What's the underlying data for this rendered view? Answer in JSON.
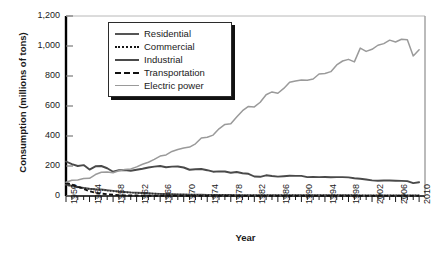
{
  "chart_data": {
    "type": "line",
    "title": "",
    "xlabel": "Year",
    "ylabel": "Consumption (millions of tons)",
    "xlim": [
      1950,
      2011
    ],
    "ylim": [
      0,
      1200
    ],
    "grid": false,
    "legend_position": "top-left-inside",
    "ytick_labels": [
      "0",
      "200",
      "400",
      "600",
      "800",
      "1,000",
      "1,200"
    ],
    "ytick_values": [
      0,
      200,
      400,
      600,
      800,
      1000,
      1200
    ],
    "xtick_labels": [
      "1950",
      "1954",
      "1958",
      "1962",
      "1966",
      "1970",
      "1974",
      "1978",
      "1982",
      "1986",
      "1990",
      "1994",
      "1998",
      "2002",
      "2006",
      "2010"
    ],
    "xtick_values": [
      1950,
      1954,
      1958,
      1962,
      1966,
      1970,
      1974,
      1978,
      1982,
      1986,
      1990,
      1994,
      1998,
      2002,
      2006,
      2010
    ],
    "x": [
      1950,
      1951,
      1952,
      1953,
      1954,
      1955,
      1956,
      1957,
      1958,
      1959,
      1960,
      1961,
      1962,
      1963,
      1964,
      1965,
      1966,
      1967,
      1968,
      1969,
      1970,
      1971,
      1972,
      1973,
      1974,
      1975,
      1976,
      1977,
      1978,
      1979,
      1980,
      1981,
      1982,
      1983,
      1984,
      1985,
      1986,
      1987,
      1988,
      1989,
      1990,
      1991,
      1992,
      1993,
      1994,
      1995,
      1996,
      1997,
      1998,
      1999,
      2000,
      2001,
      2002,
      2003,
      2004,
      2005,
      2006,
      2007,
      2008,
      2009,
      2010
    ],
    "series": [
      {
        "name": "Residential",
        "style": "solid",
        "color": "#555555",
        "values": [
          75,
          68,
          60,
          54,
          48,
          45,
          43,
          38,
          34,
          30,
          27,
          24,
          22,
          20,
          18,
          16,
          14,
          13,
          12,
          11,
          10,
          9,
          8,
          8,
          7,
          7,
          7,
          7,
          7,
          6,
          6,
          6,
          6,
          6,
          6,
          6,
          6,
          6,
          6,
          6,
          6,
          6,
          6,
          6,
          6,
          6,
          6,
          6,
          5,
          5,
          4,
          4,
          4,
          4,
          4,
          4,
          4,
          4,
          3,
          3,
          3
        ]
      },
      {
        "name": "Commercial",
        "style": "dotted",
        "color": "#151515",
        "values": [
          72,
          66,
          58,
          52,
          46,
          43,
          41,
          36,
          32,
          28,
          25,
          22,
          20,
          18,
          17,
          15,
          13,
          12,
          11,
          10,
          9,
          8,
          8,
          7,
          7,
          7,
          7,
          7,
          7,
          6,
          6,
          6,
          6,
          6,
          6,
          6,
          6,
          6,
          6,
          6,
          6,
          6,
          6,
          6,
          6,
          6,
          6,
          6,
          5,
          5,
          4,
          4,
          4,
          4,
          4,
          4,
          4,
          4,
          3,
          3,
          3
        ]
      },
      {
        "name": "Industrial",
        "style": "solid",
        "color": "#4a4a4a",
        "values": [
          230,
          212,
          200,
          206,
          176,
          198,
          200,
          185,
          162,
          172,
          173,
          168,
          175,
          182,
          190,
          196,
          200,
          192,
          196,
          197,
          190,
          175,
          178,
          180,
          172,
          162,
          164,
          163,
          155,
          160,
          152,
          148,
          130,
          128,
          138,
          133,
          129,
          132,
          135,
          134,
          134,
          126,
          127,
          126,
          127,
          125,
          126,
          126,
          124,
          118,
          115,
          110,
          104,
          102,
          103,
          103,
          102,
          101,
          99,
          86,
          92
        ]
      },
      {
        "name": "Transportation",
        "style": "dashed",
        "color": "#111111",
        "values": [
          88,
          76,
          62,
          48,
          32,
          22,
          16,
          12,
          8,
          6,
          4,
          3,
          3,
          2,
          2,
          2,
          2,
          2,
          2,
          2,
          2,
          1,
          1,
          1,
          1,
          1,
          1,
          1,
          1,
          1,
          1,
          1,
          1,
          1,
          1,
          1,
          1,
          1,
          1,
          1,
          1,
          1,
          1,
          1,
          1,
          1,
          1,
          1,
          1,
          1,
          1,
          1,
          1,
          1,
          1,
          1,
          1,
          1,
          1,
          1,
          1
        ]
      },
      {
        "name": "Electric power",
        "style": "solid",
        "color": "#9a9a9a",
        "values": [
          92,
          105,
          107,
          116,
          118,
          143,
          158,
          160,
          155,
          168,
          176,
          180,
          194,
          212,
          225,
          244,
          266,
          274,
          297,
          310,
          320,
          326,
          348,
          387,
          392,
          406,
          448,
          477,
          481,
          527,
          569,
          597,
          594,
          625,
          675,
          694,
          685,
          717,
          758,
          767,
          774,
          772,
          780,
          813,
          817,
          829,
          874,
          900,
          911,
          894,
          986,
          964,
          978,
          1005,
          1016,
          1039,
          1027,
          1045,
          1042,
          934,
          975
        ]
      }
    ]
  },
  "legend": {
    "items": [
      {
        "label": "Residential",
        "swatch": "solid-dark-line-icon"
      },
      {
        "label": "Commercial",
        "swatch": "dotted-line-icon"
      },
      {
        "label": "Industrial",
        "swatch": "solid-line-icon"
      },
      {
        "label": "Transportation",
        "swatch": "dashed-line-icon"
      },
      {
        "label": "Electric power",
        "swatch": "solid-gray-line-icon"
      }
    ]
  }
}
